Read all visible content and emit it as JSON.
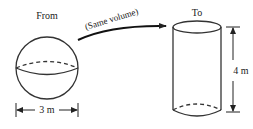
{
  "diagram": {
    "from_label": "From",
    "to_label": "To",
    "arrow_label": "(Same volume)",
    "sphere": {
      "shape": "sphere",
      "dimension_label": "3 m",
      "dimension_type": "diameter"
    },
    "cylinder": {
      "shape": "cylinder",
      "dimension_label": "4 m",
      "dimension_type": "height"
    },
    "colors": {
      "stroke": "#333333",
      "background": "#ffffff"
    }
  }
}
